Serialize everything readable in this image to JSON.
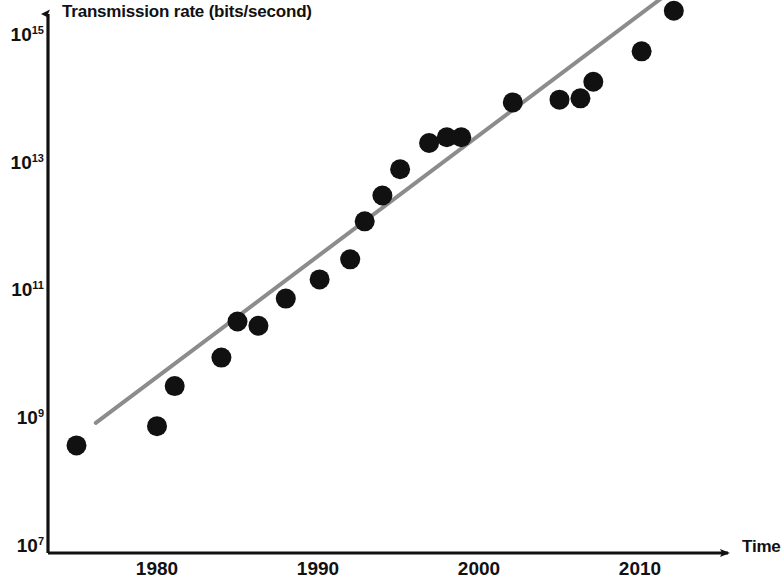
{
  "chart_data": {
    "type": "scatter",
    "title": "",
    "xlabel": "Time",
    "ylabel": "Transmission rate (bits/second)",
    "y_scale": "log",
    "yticks": [
      {
        "label_mantissa": "10",
        "label_exponent": "7",
        "value": 10000000.0
      },
      {
        "label_mantissa": "10",
        "label_exponent": "9",
        "value": 1000000000.0
      },
      {
        "label_mantissa": "10",
        "label_exponent": "11",
        "value": 100000000000.0
      },
      {
        "label_mantissa": "10",
        "label_exponent": "13",
        "value": 10000000000000.0
      },
      {
        "label_mantissa": "10",
        "label_exponent": "15",
        "value": 1000000000000000.0
      }
    ],
    "xticks": [
      "1980",
      "1990",
      "2000",
      "2010"
    ],
    "xlim": [
      1973.5,
      2015.5
    ],
    "ylim": [
      10000000.0,
      3200000000000000.0
    ],
    "grid": false,
    "legend": null,
    "marker_color": "#111111",
    "trendline_color": "#8c8c8c",
    "axis_color": "#111111",
    "points": [
      {
        "x": 1975.0,
        "y": 400000000.0
      },
      {
        "x": 1980.0,
        "y": 800000000.0
      },
      {
        "x": 1981.1,
        "y": 3400000000.0
      },
      {
        "x": 1984.0,
        "y": 9500000000.0
      },
      {
        "x": 1985.0,
        "y": 35000000000.0
      },
      {
        "x": 1986.3,
        "y": 30000000000.0
      },
      {
        "x": 1988.0,
        "y": 80000000000.0
      },
      {
        "x": 1990.1,
        "y": 160000000000.0
      },
      {
        "x": 1992.0,
        "y": 330000000000.0
      },
      {
        "x": 1992.9,
        "y": 1300000000000.0
      },
      {
        "x": 1994.0,
        "y": 3300000000000.0
      },
      {
        "x": 1995.1,
        "y": 8500000000000.0
      },
      {
        "x": 1996.9,
        "y": 22000000000000.0
      },
      {
        "x": 1998.0,
        "y": 27000000000000.0
      },
      {
        "x": 1998.9,
        "y": 27000000000000.0
      },
      {
        "x": 2002.1,
        "y": 95000000000000.0
      },
      {
        "x": 2005.0,
        "y": 105000000000000.0
      },
      {
        "x": 2006.3,
        "y": 110000000000000.0
      },
      {
        "x": 2007.1,
        "y": 200000000000000.0
      },
      {
        "x": 2010.1,
        "y": 600000000000000.0
      },
      {
        "x": 2012.1,
        "y": 2600000000000000.0
      },
      {
        "x": 2013.2,
        "y": 8500000000000000.0
      }
    ],
    "trendline": {
      "x_start": 1976.2,
      "y_start": 900000000.0,
      "x_end": 2012.4,
      "y_end": 6500000000000000.0
    }
  }
}
